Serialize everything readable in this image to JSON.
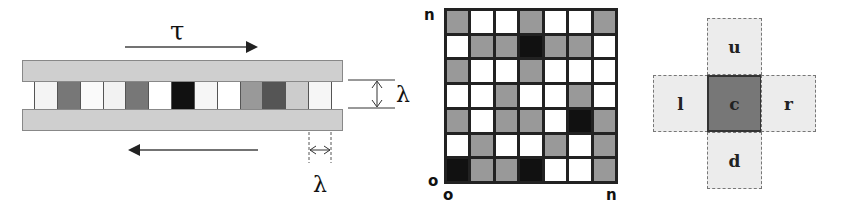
{
  "left_panel": {
    "shear_label": "τ",
    "height_label": "λ",
    "width_label": "λ",
    "cells": [
      "#f4f4f4",
      "#777777",
      "#fafafa",
      "#f2f2f2",
      "#777777",
      "#ffffff",
      "#111111",
      "#f6f6f6",
      "#ffffff",
      "#999999",
      "#555555",
      "#cccccc",
      "#f6f6f6"
    ]
  },
  "grid_panel": {
    "y_axis_top_label": "n",
    "y_axis_origin_label": "o",
    "x_axis_origin_label": "o",
    "x_axis_end_label": "n",
    "colors": {
      "G": "#999999",
      "W": "#ffffff",
      "B": "#111111"
    },
    "rows": [
      [
        "G",
        "W",
        "W",
        "G",
        "W",
        "W",
        "G"
      ],
      [
        "W",
        "G",
        "G",
        "B",
        "G",
        "G",
        "W"
      ],
      [
        "G",
        "W",
        "W",
        "G",
        "W",
        "W",
        "W"
      ],
      [
        "W",
        "W",
        "G",
        "W",
        "W",
        "G",
        "W"
      ],
      [
        "G",
        "W",
        "G",
        "G",
        "W",
        "B",
        "G"
      ],
      [
        "W",
        "G",
        "W",
        "W",
        "G",
        "W",
        "G"
      ],
      [
        "B",
        "G",
        "G",
        "B",
        "W",
        "W",
        "G"
      ]
    ]
  },
  "neighborhood_panel": {
    "up": "u",
    "left": "l",
    "center": "c",
    "right": "r",
    "down": "d"
  }
}
